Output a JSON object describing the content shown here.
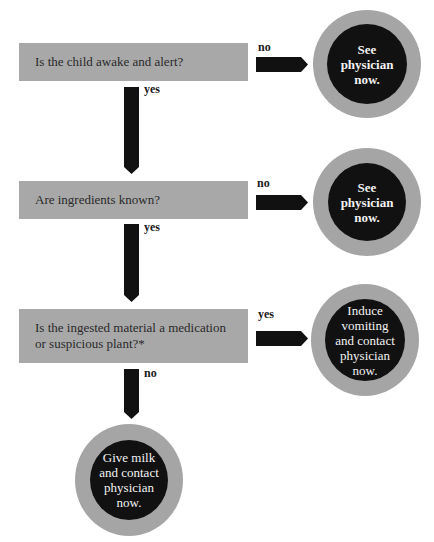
{
  "colors": {
    "question_box": "#a8a8a8",
    "arrow": "#111111",
    "circle_outer": "#a5a5a5",
    "circle_inner": "#111111",
    "circle_text": "#f2f2f2"
  },
  "nodes": {
    "q1": {
      "text": "Is the child awake and alert?"
    },
    "q2": {
      "text": "Are ingredients known?"
    },
    "q3": {
      "text": "Is the ingested material a medication or suspicious plant?*"
    },
    "outcome1": {
      "lines": [
        "See",
        "physician",
        "now."
      ]
    },
    "outcome2": {
      "lines": [
        "See",
        "physician",
        "now."
      ]
    },
    "outcome3": {
      "lines": [
        "Induce",
        "vomiting",
        "and contact",
        "physician",
        "now."
      ]
    },
    "outcome4": {
      "lines": [
        "Give milk",
        "and contact",
        "physician",
        "now."
      ]
    }
  },
  "edges": {
    "q1_to_outcome1": {
      "label": "no"
    },
    "q1_to_q2": {
      "label": "yes"
    },
    "q2_to_outcome2": {
      "label": "no"
    },
    "q2_to_q3": {
      "label": "yes"
    },
    "q3_to_outcome3": {
      "label": "yes"
    },
    "q3_to_outcome4": {
      "label": "no"
    }
  }
}
